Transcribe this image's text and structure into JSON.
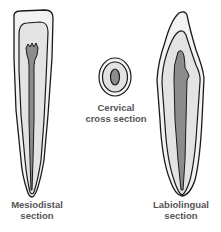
{
  "colors": {
    "enamel": "#f4f4f4",
    "dentin": "#e2e2e2",
    "pulp": "#8c8c8c",
    "outline": "#1a1a1a",
    "label": "#555555"
  },
  "panels": [
    {
      "name": "mesiodistal",
      "label_line1": "Mesiodistal",
      "label_line2": "section"
    },
    {
      "name": "cervical",
      "label_line1": "Cervical",
      "label_line2": "cross section"
    },
    {
      "name": "labiolingual",
      "label_line1": "Labiolingual",
      "label_line2": "section"
    }
  ]
}
